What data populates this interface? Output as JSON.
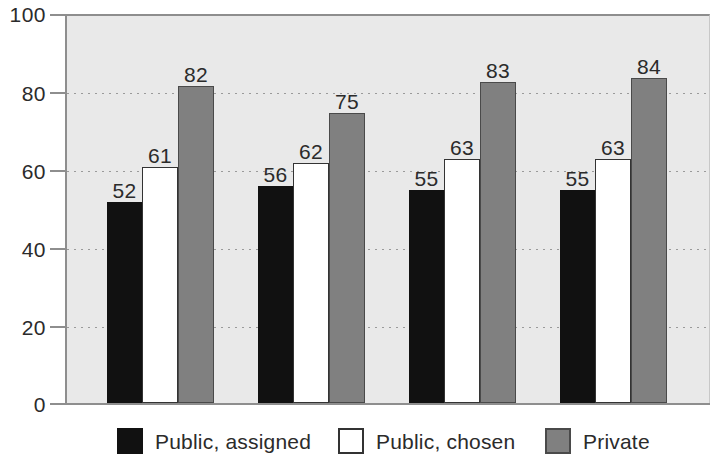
{
  "chart_data": {
    "type": "bar",
    "title": "",
    "subtitle": "",
    "xlabel": "",
    "ylabel": "",
    "ylim": [
      0,
      100
    ],
    "y_ticks": [
      0,
      20,
      40,
      60,
      80,
      100
    ],
    "y_tick_labels": [
      "0",
      "20",
      "40",
      "60",
      "80",
      "100"
    ],
    "categories": [
      "Group 1",
      "Group 2",
      "Group 3",
      "Group 4"
    ],
    "category_labels_visible": false,
    "grid": "horizontal-dotted",
    "legend_position": "bottom",
    "series": [
      {
        "name": "Public, assigned",
        "color": "#111111",
        "values": [
          52,
          56,
          55,
          55
        ],
        "data_labels": [
          "52",
          "56",
          "55",
          "55"
        ]
      },
      {
        "name": "Public, chosen",
        "color": "#ffffff",
        "values": [
          61,
          62,
          63,
          63
        ],
        "data_labels": [
          "61",
          "62",
          "63",
          "63"
        ]
      },
      {
        "name": "Private",
        "color": "#808080",
        "values": [
          82,
          75,
          83,
          84
        ],
        "data_labels": [
          "82",
          "75",
          "83",
          "84"
        ]
      }
    ]
  },
  "axis": {
    "y_labels": [
      "100",
      "80",
      "60",
      "40",
      "20",
      "0"
    ]
  },
  "legend": {
    "items": [
      {
        "label": "Public, assigned",
        "swatch": "black-square-icon"
      },
      {
        "label": "Public, chosen",
        "swatch": "white-square-icon"
      },
      {
        "label": "Private",
        "swatch": "gray-square-icon"
      }
    ]
  },
  "colors": {
    "plot_background": "#e9e9e9",
    "page_background": "#ffffff",
    "axis": "#8e8e8e",
    "text": "#2b2b2b",
    "series_assigned": "#111111",
    "series_chosen": "#ffffff",
    "series_private": "#808080"
  }
}
